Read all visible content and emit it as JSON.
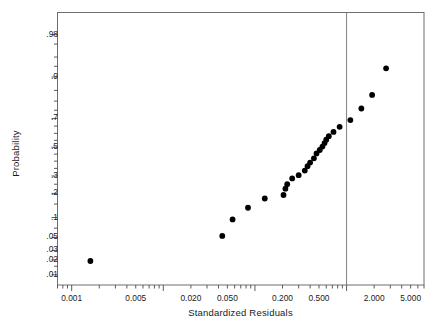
{
  "chart_data": {
    "type": "scatter",
    "title": "",
    "xlabel": "Standardized Residuals",
    "ylabel": "Probability",
    "xscale": "log",
    "yscale": "normal-probability",
    "grid": false,
    "legend": null,
    "xlim": [
      0.0007,
      7.0
    ],
    "ylim": [
      0.006,
      0.993
    ],
    "xticks": [
      {
        "value": 0.001,
        "label": "0.001"
      },
      {
        "value": 0.005,
        "label": "0.005"
      },
      {
        "value": 0.02,
        "label": "0.020"
      },
      {
        "value": 0.05,
        "label": "0.050"
      },
      {
        "value": 0.2,
        "label": "0.200"
      },
      {
        "value": 0.5,
        "label": "0.500"
      },
      {
        "value": 2.0,
        "label": "2.000"
      },
      {
        "value": 5.0,
        "label": "5.000"
      }
    ],
    "yticks": [
      {
        "value": 0.98,
        "label": ".98"
      },
      {
        "value": 0.9,
        "label": ".9"
      },
      {
        "value": 0.7,
        "label": ".7"
      },
      {
        "value": 0.5,
        "label": ".5"
      },
      {
        "value": 0.3,
        "label": ".3"
      },
      {
        "value": 0.2,
        "label": ".2"
      },
      {
        "value": 0.1,
        "label": ".1"
      },
      {
        "value": 0.05,
        "label": ".05"
      },
      {
        "value": 0.03,
        "label": ".03"
      },
      {
        "value": 0.02,
        "label": ".02"
      },
      {
        "value": 0.01,
        "label": ".01"
      }
    ],
    "annotations": [
      {
        "type": "vline",
        "name": "reference-line",
        "x": 1.0,
        "color": "#808080"
      }
    ],
    "series": [
      {
        "name": "standardized-residuals",
        "marker": "filled-circle",
        "color": "#000000",
        "points": [
          {
            "x": 0.0016,
            "y": 0.019
          },
          {
            "x": 0.044,
            "y": 0.053
          },
          {
            "x": 0.057,
            "y": 0.094
          },
          {
            "x": 0.084,
            "y": 0.135
          },
          {
            "x": 0.128,
            "y": 0.175
          },
          {
            "x": 0.205,
            "y": 0.192
          },
          {
            "x": 0.215,
            "y": 0.225
          },
          {
            "x": 0.225,
            "y": 0.25
          },
          {
            "x": 0.255,
            "y": 0.285
          },
          {
            "x": 0.3,
            "y": 0.305
          },
          {
            "x": 0.35,
            "y": 0.335
          },
          {
            "x": 0.375,
            "y": 0.365
          },
          {
            "x": 0.4,
            "y": 0.39
          },
          {
            "x": 0.44,
            "y": 0.42
          },
          {
            "x": 0.47,
            "y": 0.455
          },
          {
            "x": 0.51,
            "y": 0.48
          },
          {
            "x": 0.545,
            "y": 0.505
          },
          {
            "x": 0.575,
            "y": 0.53
          },
          {
            "x": 0.6,
            "y": 0.555
          },
          {
            "x": 0.64,
            "y": 0.58
          },
          {
            "x": 0.72,
            "y": 0.61
          },
          {
            "x": 0.84,
            "y": 0.645
          },
          {
            "x": 1.1,
            "y": 0.69
          },
          {
            "x": 1.45,
            "y": 0.76
          },
          {
            "x": 1.9,
            "y": 0.83
          },
          {
            "x": 2.7,
            "y": 0.925
          }
        ]
      }
    ]
  }
}
